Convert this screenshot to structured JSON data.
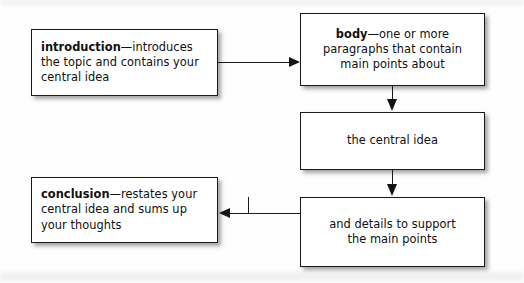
{
  "diagram": {
    "background_color": "#fefefe",
    "line_color": "#1a1a1a",
    "text_color": "#101010",
    "nodes": [
      {
        "id": "introduction",
        "lead": "introduction",
        "dash": "—",
        "rest_line1": "introduces",
        "rest_line2": "the topic and contains your",
        "rest_line3": "central idea",
        "align": "left"
      },
      {
        "id": "body",
        "lead": "body",
        "dash": "—",
        "rest_line1": "one or more",
        "rest_line2": "paragraphs that contain",
        "rest_line3": "main points about",
        "align": "center"
      },
      {
        "id": "central-idea",
        "line1": "the central idea",
        "align": "center"
      },
      {
        "id": "details",
        "line1": "and details to support",
        "line2": "the main points",
        "align": "center"
      },
      {
        "id": "conclusion",
        "lead": "conclusion",
        "dash": "—",
        "rest_line1": "restates your",
        "rest_line2": "central idea and sums up",
        "rest_line3": "your thoughts",
        "align": "left"
      }
    ],
    "connectors": [
      {
        "id": "intro-to-body",
        "from": "introduction",
        "to": "body",
        "direction": "right"
      },
      {
        "id": "body-to-central",
        "from": "body",
        "to": "central-idea",
        "direction": "down"
      },
      {
        "id": "central-to-details",
        "from": "central-idea",
        "to": "details",
        "direction": "down"
      },
      {
        "id": "details-to-conclusion",
        "from": "details",
        "to": "conclusion",
        "direction": "left"
      }
    ]
  }
}
